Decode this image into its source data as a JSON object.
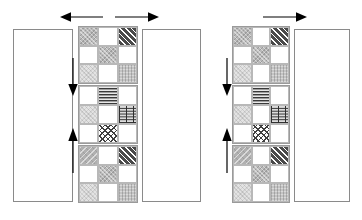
{
  "figure": {
    "background_color": "#ffffff",
    "line_color": "#8a8a8a",
    "arrow_color": "#000000"
  },
  "palette": {
    "white": "#ffffff",
    "light_gray": "#e3e3e3",
    "medium_gray": "#b9b9b9",
    "dark_hatch": "#4a4a4a",
    "outline": "#8a8a8a",
    "cell_outline": "#b8b8b8"
  },
  "panels": [
    {
      "id": "left-panel",
      "name": "left-panel",
      "bars": [
        {
          "name": "bar-left-outer",
          "label": ""
        },
        {
          "name": "bar-left-inner",
          "label": ""
        }
      ],
      "horizontal_arrows": [
        {
          "name": "arrow-left",
          "direction": "left",
          "label": ""
        },
        {
          "name": "arrow-right",
          "direction": "right",
          "label": ""
        }
      ],
      "vertical_arrows": [
        {
          "name": "arrow-down",
          "direction": "down",
          "label": ""
        },
        {
          "name": "arrow-up",
          "direction": "up",
          "label": ""
        }
      ],
      "blocks": [
        {
          "name": "block-top",
          "rows": [
            [
              "gray",
              "white",
              "diag"
            ],
            [
              "white",
              "gray",
              "white"
            ],
            [
              "ltgray",
              "white",
              "noise"
            ]
          ]
        },
        {
          "name": "block-middle",
          "rows": [
            [
              "white",
              "hlines",
              "white"
            ],
            [
              "ltgray",
              "white",
              "weave"
            ],
            [
              "white",
              "diamond",
              "white"
            ]
          ]
        },
        {
          "name": "block-bottom",
          "rows": [
            [
              "diagsoft",
              "white",
              "diag"
            ],
            [
              "white",
              "gray",
              "white"
            ],
            [
              "ltgray",
              "white",
              "noise"
            ]
          ]
        }
      ]
    },
    {
      "id": "right-panel",
      "name": "right-panel",
      "bars": [
        {
          "name": "bar-right-outer",
          "label": ""
        }
      ],
      "horizontal_arrows": [
        {
          "name": "arrow-right",
          "direction": "right",
          "label": ""
        }
      ],
      "vertical_arrows": [
        {
          "name": "arrow-down",
          "direction": "down",
          "label": ""
        },
        {
          "name": "arrow-up",
          "direction": "up",
          "label": ""
        }
      ],
      "blocks": [
        {
          "name": "block-top",
          "rows": [
            [
              "gray",
              "white",
              "diag"
            ],
            [
              "white",
              "gray",
              "white"
            ],
            [
              "ltgray",
              "white",
              "noise"
            ]
          ]
        },
        {
          "name": "block-middle",
          "rows": [
            [
              "white",
              "hlines",
              "white"
            ],
            [
              "ltgray",
              "white",
              "weave"
            ],
            [
              "white",
              "diamond",
              "white"
            ]
          ]
        },
        {
          "name": "block-bottom",
          "rows": [
            [
              "diagsoft",
              "white",
              "diag"
            ],
            [
              "white",
              "gray",
              "white"
            ],
            [
              "ltgray",
              "white",
              "noise"
            ]
          ]
        }
      ]
    }
  ]
}
